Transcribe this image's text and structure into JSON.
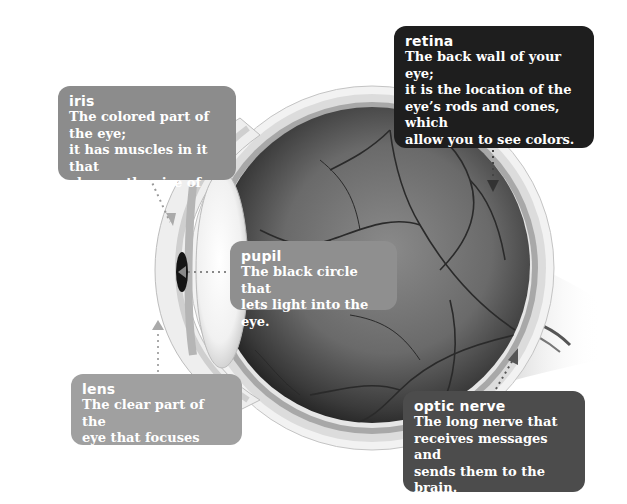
{
  "diagram": {
    "colors": {
      "background": "#ffffff",
      "retina_box": "#1e1e1e",
      "iris_box": "#8c8c8c",
      "pupil_box": "#8f8f8f",
      "lens_box": "#a0a0a0",
      "optic_nerve_box": "#4c4c4c",
      "label_text": "#ffffff"
    },
    "callouts": {
      "retina": {
        "term": "retina",
        "description": "The back wall of your eye;\nit is the location of the\neye’s rods and cones, which\nallow you to see colors."
      },
      "iris": {
        "term": "iris",
        "description": "The colored part of the eye;\nit has muscles in it that\nchange the size of the pupil."
      },
      "pupil": {
        "term": "pupil",
        "description": "The black circle that\nlets light into the eye."
      },
      "lens": {
        "term": "lens",
        "description": "The clear part of the\neye that focuses light."
      },
      "optic_nerve": {
        "term": "optic nerve",
        "description": "The long nerve that\nreceives messages and\nsends them to the brain."
      }
    }
  }
}
